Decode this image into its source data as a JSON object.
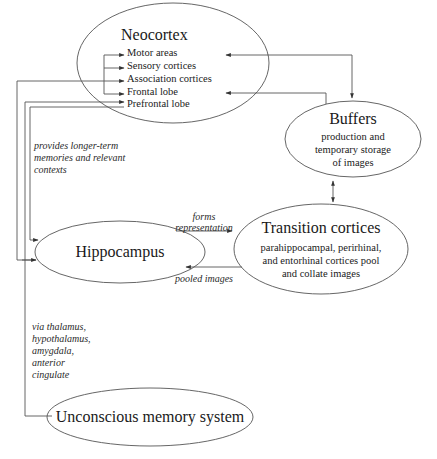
{
  "diagram": {
    "nodes": {
      "neocortex": {
        "title": "Neocortex",
        "items": [
          "Motor areas",
          "Sensory cortices",
          "Association cortices",
          "Frontal lobe",
          "Prefrontal lobe"
        ]
      },
      "buffers": {
        "title": "Buffers",
        "lines": [
          "production and",
          "temporary storage",
          "of images"
        ]
      },
      "transition": {
        "title": "Transition cortices",
        "lines": [
          "parahippocampal, perirhinal,",
          "and entorhinal cortices pool",
          "and collate images"
        ]
      },
      "hippocampus": {
        "title": "Hippocampus"
      },
      "unconscious": {
        "title": "Unconscious memory system"
      }
    },
    "edge_labels": {
      "provides": [
        "provides longer-term",
        "memories and relevant",
        "contexts"
      ],
      "forms": [
        "forms",
        "representation"
      ],
      "pooled": "pooled images",
      "via": [
        "via thalamus,",
        "hypothalamus,",
        "amygdala,",
        "anterior",
        "cingulate"
      ]
    },
    "colors": {
      "stroke": "#555555",
      "text": "#1a1a1a"
    }
  }
}
